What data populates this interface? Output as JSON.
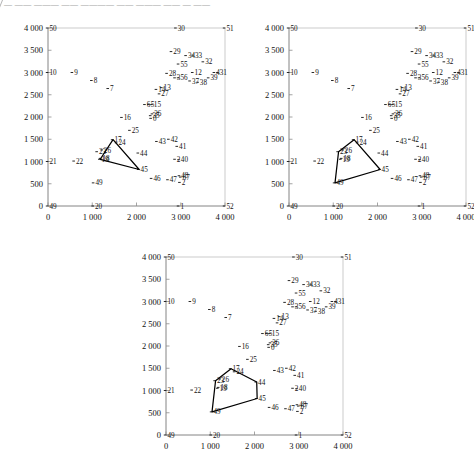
{
  "page": {
    "top_fragment": "— —— ——— —— ———— —— ——— —— — ——",
    "background": "#ffffff",
    "ink": "#000000"
  },
  "chart_data": [
    {
      "type": "scatter",
      "id": "panel-1",
      "title": "",
      "xlabel": "",
      "ylabel": "",
      "xlim": [
        0,
        4000
      ],
      "ylim": [
        0,
        4000
      ],
      "xticks": [
        0,
        1000,
        2000,
        3000,
        4000
      ],
      "xticklabels": [
        "0",
        "1 000",
        "2 000",
        "3 000",
        "4 000"
      ],
      "yticks": [
        0,
        500,
        1000,
        1500,
        2000,
        2500,
        3000,
        3500,
        4000
      ],
      "yticklabels": [
        "0",
        "500",
        "1 000",
        "1 500",
        "2 000",
        "2 500",
        "3 000",
        "3 500",
        "4 000"
      ],
      "grid": false,
      "legend": "none",
      "points": [
        {
          "label": "50",
          "x": 0,
          "y": 4000
        },
        {
          "label": "30",
          "x": 2900,
          "y": 4000
        },
        {
          "label": "51",
          "x": 4000,
          "y": 4000
        },
        {
          "label": "10",
          "x": 0,
          "y": 3000
        },
        {
          "label": "21",
          "x": 0,
          "y": 1000
        },
        {
          "label": "49",
          "x": 0,
          "y": 0
        },
        {
          "label": "20",
          "x": 1030,
          "y": 0
        },
        {
          "label": "1",
          "x": 2960,
          "y": 0
        },
        {
          "label": "52",
          "x": 4000,
          "y": 0
        },
        {
          "label": "9",
          "x": 560,
          "y": 3000
        },
        {
          "label": "8",
          "x": 1000,
          "y": 2820
        },
        {
          "label": "7",
          "x": 1370,
          "y": 2640
        },
        {
          "label": "22",
          "x": 600,
          "y": 1010
        },
        {
          "label": "23",
          "x": 1120,
          "y": 1220
        },
        {
          "label": "26",
          "x": 1230,
          "y": 1260
        },
        {
          "label": "17",
          "x": 1470,
          "y": 1490
        },
        {
          "label": "24",
          "x": 1560,
          "y": 1420
        },
        {
          "label": "18",
          "x": 1200,
          "y": 1070
        },
        {
          "label": "19",
          "x": 1180,
          "y": 1050
        },
        {
          "label": "49b",
          "x": 1040,
          "y": 520
        },
        {
          "label": "45",
          "x": 2060,
          "y": 820
        },
        {
          "label": "44",
          "x": 2050,
          "y": 1190
        },
        {
          "label": "25",
          "x": 1860,
          "y": 1700
        },
        {
          "label": "16",
          "x": 1680,
          "y": 1990
        },
        {
          "label": "5",
          "x": 2290,
          "y": 2280
        },
        {
          "label": "6",
          "x": 2200,
          "y": 2280
        },
        {
          "label": "15",
          "x": 2360,
          "y": 2280
        },
        {
          "label": "36",
          "x": 2370,
          "y": 2070
        },
        {
          "label": "35",
          "x": 2330,
          "y": 2030
        },
        {
          "label": "0",
          "x": 2340,
          "y": 1970
        },
        {
          "label": "14",
          "x": 2460,
          "y": 2620
        },
        {
          "label": "13",
          "x": 2580,
          "y": 2660
        },
        {
          "label": "27",
          "x": 2530,
          "y": 2520
        },
        {
          "label": "28",
          "x": 2700,
          "y": 2980
        },
        {
          "label": "29",
          "x": 2800,
          "y": 3470
        },
        {
          "label": "34",
          "x": 3130,
          "y": 3380
        },
        {
          "label": "33",
          "x": 3290,
          "y": 3390
        },
        {
          "label": "32",
          "x": 3520,
          "y": 3240
        },
        {
          "label": "31",
          "x": 3850,
          "y": 3000
        },
        {
          "label": "4",
          "x": 3770,
          "y": 3000
        },
        {
          "label": "39",
          "x": 3640,
          "y": 2880
        },
        {
          "label": "12",
          "x": 3280,
          "y": 3000
        },
        {
          "label": "37",
          "x": 3220,
          "y": 2810
        },
        {
          "label": "38",
          "x": 3400,
          "y": 2780
        },
        {
          "label": "3",
          "x": 2880,
          "y": 2880
        },
        {
          "label": "56",
          "x": 2960,
          "y": 2880
        },
        {
          "label": "55",
          "x": 2960,
          "y": 3190
        },
        {
          "label": "43",
          "x": 2470,
          "y": 1450
        },
        {
          "label": "42",
          "x": 2740,
          "y": 1500
        },
        {
          "label": "41",
          "x": 2930,
          "y": 1340
        },
        {
          "label": "40",
          "x": 2970,
          "y": 1040
        },
        {
          "label": "2b",
          "x": 2880,
          "y": 1050
        },
        {
          "label": "46",
          "x": 2350,
          "y": 620
        },
        {
          "label": "47",
          "x": 2720,
          "y": 590
        },
        {
          "label": "48",
          "x": 2980,
          "y": 680
        },
        {
          "label": "67",
          "x": 3010,
          "y": 650
        },
        {
          "label": "2",
          "x": 2990,
          "y": 530
        }
      ],
      "polygon": {
        "name": "triangle",
        "vertices": [
          [
            1470,
            1490
          ],
          [
            2060,
            820
          ],
          [
            1180,
            1050
          ]
        ]
      }
    },
    {
      "type": "scatter",
      "id": "panel-2",
      "title": "",
      "xlabel": "",
      "ylabel": "",
      "xlim": [
        0,
        4000
      ],
      "ylim": [
        0,
        4000
      ],
      "xticks": [
        0,
        1000,
        2000,
        3000,
        4000
      ],
      "xticklabels": [
        "0",
        "1 000",
        "2 000",
        "3 000",
        "4 000"
      ],
      "yticks": [
        0,
        500,
        1000,
        1500,
        2000,
        2500,
        3000,
        3500,
        4000
      ],
      "yticklabels": [
        "0",
        "500",
        "1 000",
        "1 500",
        "2 000",
        "2 500",
        "3 000",
        "3 500",
        "4 000"
      ],
      "grid": false,
      "legend": "none",
      "polygon": {
        "name": "quadrilateral",
        "vertices": [
          [
            1470,
            1490
          ],
          [
            2060,
            820
          ],
          [
            1040,
            520
          ],
          [
            1120,
            1220
          ]
        ]
      }
    },
    {
      "type": "scatter",
      "id": "panel-3",
      "title": "",
      "xlabel": "",
      "ylabel": "",
      "xlim": [
        0,
        4000
      ],
      "ylim": [
        0,
        4000
      ],
      "xticks": [
        0,
        1000,
        2000,
        3000,
        4000
      ],
      "xticklabels": [
        "0",
        "1 000",
        "2 000",
        "3 000",
        "4 000"
      ],
      "yticks": [
        0,
        500,
        1000,
        1500,
        2000,
        2500,
        3000,
        3500,
        4000
      ],
      "yticklabels": [
        "0",
        "500",
        "1 000",
        "1 500",
        "2 000",
        "2 500",
        "3 000",
        "3 500",
        "4 000"
      ],
      "grid": false,
      "legend": "none",
      "polygon": {
        "name": "pentagon",
        "vertices": [
          [
            1470,
            1490
          ],
          [
            2050,
            1190
          ],
          [
            2060,
            820
          ],
          [
            1040,
            520
          ],
          [
            1120,
            1220
          ]
        ]
      }
    }
  ]
}
